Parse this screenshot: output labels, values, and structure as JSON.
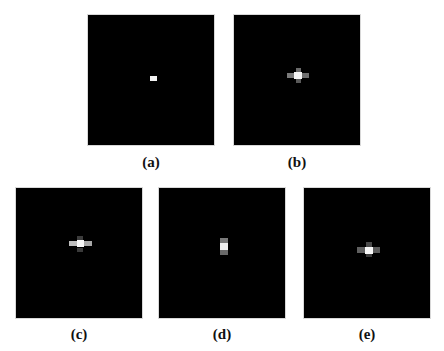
{
  "figure": {
    "panels": [
      {
        "id": "a",
        "label": "(a)",
        "box": [
          87,
          14,
          128,
          132
        ],
        "label_pos": [
          87,
          154
        ],
        "cells": [
          {
            "x": 62,
            "y": 61,
            "w": 7,
            "h": 5,
            "color": "#f2f2f2"
          }
        ]
      },
      {
        "id": "b",
        "label": "(b)",
        "box": [
          233,
          14,
          128,
          132
        ],
        "label_pos": [
          233,
          154
        ],
        "cells": [
          {
            "x": 62,
            "y": 53,
            "w": 5,
            "h": 4,
            "color": "#6a6a6a"
          },
          {
            "x": 53,
            "y": 58,
            "w": 7,
            "h": 5,
            "color": "#7a7a7a"
          },
          {
            "x": 60,
            "y": 57,
            "w": 8,
            "h": 7,
            "color": "#f4f4f4"
          },
          {
            "x": 68,
            "y": 58,
            "w": 7,
            "h": 5,
            "color": "#6e6e6e"
          },
          {
            "x": 62,
            "y": 64,
            "w": 5,
            "h": 4,
            "color": "#5a5a5a"
          }
        ]
      },
      {
        "id": "c",
        "label": "(c)",
        "box": [
          15,
          187,
          128,
          132
        ],
        "label_pos": [
          15,
          326
        ],
        "cells": [
          {
            "x": 61,
            "y": 48,
            "w": 6,
            "h": 4,
            "color": "#3c3c3c"
          },
          {
            "x": 53,
            "y": 53,
            "w": 8,
            "h": 5,
            "color": "#bdbdbd"
          },
          {
            "x": 61,
            "y": 52,
            "w": 7,
            "h": 7,
            "color": "#f6f6f6"
          },
          {
            "x": 68,
            "y": 53,
            "w": 8,
            "h": 5,
            "color": "#a8a8a8"
          },
          {
            "x": 61,
            "y": 60,
            "w": 6,
            "h": 4,
            "color": "#3a3a3a"
          }
        ]
      },
      {
        "id": "d",
        "label": "(d)",
        "box": [
          158,
          187,
          128,
          132
        ],
        "label_pos": [
          158,
          326
        ],
        "cells": [
          {
            "x": 61,
            "y": 50,
            "w": 8,
            "h": 5,
            "color": "#7a7a7a"
          },
          {
            "x": 61,
            "y": 55,
            "w": 8,
            "h": 7,
            "color": "#f0f0f0"
          },
          {
            "x": 61,
            "y": 62,
            "w": 8,
            "h": 5,
            "color": "#6a6a6a"
          }
        ]
      },
      {
        "id": "e",
        "label": "(e)",
        "box": [
          303,
          187,
          128,
          132
        ],
        "label_pos": [
          303,
          326
        ],
        "cells": [
          {
            "x": 62,
            "y": 54,
            "w": 6,
            "h": 5,
            "color": "#4a4a4a"
          },
          {
            "x": 53,
            "y": 59,
            "w": 8,
            "h": 6,
            "color": "#606060"
          },
          {
            "x": 61,
            "y": 59,
            "w": 8,
            "h": 7,
            "color": "#f8f8f8"
          },
          {
            "x": 69,
            "y": 59,
            "w": 7,
            "h": 6,
            "color": "#5c5c5c"
          },
          {
            "x": 62,
            "y": 66,
            "w": 6,
            "h": 3,
            "color": "#3c3c3c"
          }
        ]
      }
    ]
  }
}
